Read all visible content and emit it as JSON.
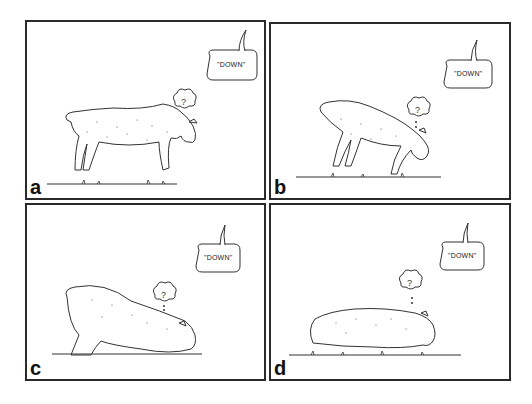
{
  "figure": {
    "panels": [
      {
        "id": "a",
        "letter": "a",
        "speech": "\"DOWN\"",
        "thought": "?",
        "pose": "standing, head lowered"
      },
      {
        "id": "b",
        "letter": "b",
        "speech": "\"DOWN\"",
        "thought": "?",
        "pose": "bowing, front legs stretched"
      },
      {
        "id": "c",
        "letter": "c",
        "speech": "\"DOWN\"",
        "thought": "?",
        "pose": "front down, rear partly raised"
      },
      {
        "id": "d",
        "letter": "d",
        "speech": "\"DOWN\"",
        "thought": "?",
        "pose": "lying down"
      }
    ],
    "colors": {
      "line": "#2a2a2a",
      "background": "#ffffff"
    }
  }
}
